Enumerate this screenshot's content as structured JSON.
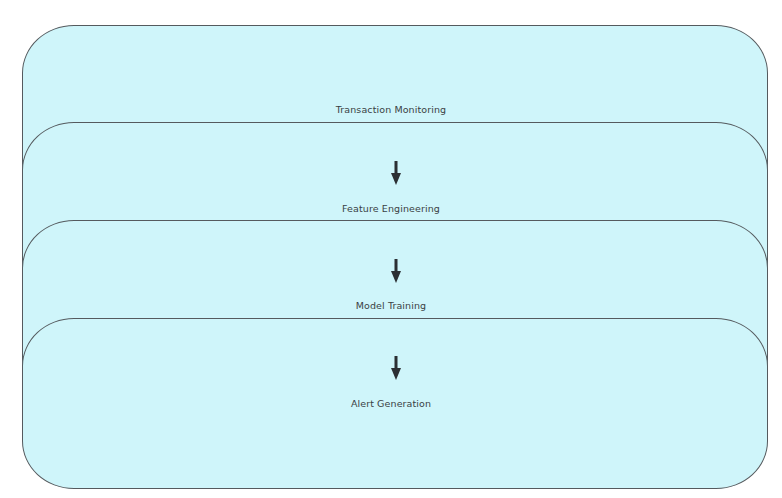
{
  "diagram": {
    "type": "flowchart",
    "direction": "top-to-bottom",
    "colors": {
      "box_fill": "#cff5fa",
      "box_border": "#555a5e",
      "arrow": "#2b2f33",
      "text": "#3a3f44"
    },
    "stages": [
      {
        "label": "Transaction Monitoring"
      },
      {
        "label": "Feature Engineering"
      },
      {
        "label": "Model Training"
      },
      {
        "label": "Alert Generation"
      }
    ],
    "edges": [
      {
        "from": "Transaction Monitoring",
        "to": "Feature Engineering",
        "icon": "down-arrow-icon"
      },
      {
        "from": "Feature Engineering",
        "to": "Model Training",
        "icon": "down-arrow-icon"
      },
      {
        "from": "Model Training",
        "to": "Alert Generation",
        "icon": "down-arrow-icon"
      }
    ]
  }
}
